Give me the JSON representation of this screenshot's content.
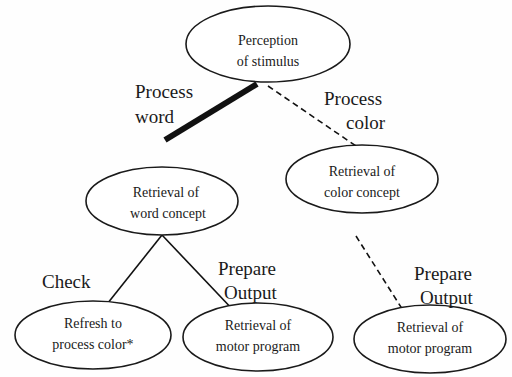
{
  "diagram": {
    "type": "tree",
    "nodes": [
      {
        "id": "perception",
        "lines": [
          "Perception",
          "of stimulus"
        ]
      },
      {
        "id": "color_concept",
        "lines": [
          "Retrieval of",
          "color concept"
        ]
      },
      {
        "id": "word_concept",
        "lines": [
          "Retrieval of",
          "word concept"
        ]
      },
      {
        "id": "refresh",
        "lines": [
          "Refresh to",
          "process color*"
        ]
      },
      {
        "id": "motor_word",
        "lines": [
          "Retrieval of",
          "motor program"
        ]
      },
      {
        "id": "motor_color",
        "lines": [
          "Retrieval of",
          "motor program"
        ]
      }
    ],
    "edges": [
      {
        "from": "perception",
        "to": "word_concept",
        "style": "thick-solid",
        "label": [
          "Process",
          "word"
        ]
      },
      {
        "from": "perception",
        "to": "color_concept",
        "style": "dashed",
        "label": [
          "Process",
          "color"
        ]
      },
      {
        "from": "word_concept",
        "to": "refresh",
        "style": "solid",
        "label": [
          "Check"
        ]
      },
      {
        "from": "word_concept",
        "to": "motor_word",
        "style": "solid",
        "label": [
          "Prepare",
          "Output"
        ]
      },
      {
        "from": "color_concept",
        "to": "motor_color",
        "style": "dashed",
        "label": [
          "Prepare",
          "Output"
        ]
      }
    ]
  }
}
